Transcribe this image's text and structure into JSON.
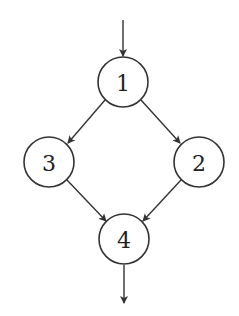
{
  "diagram": {
    "type": "directed-graph",
    "nodes": [
      {
        "id": "1",
        "label": "1",
        "cx": 123,
        "cy": 82
      },
      {
        "id": "2",
        "label": "2",
        "cx": 199,
        "cy": 162
      },
      {
        "id": "3",
        "label": "3",
        "cx": 49,
        "cy": 162
      },
      {
        "id": "4",
        "label": "4",
        "cx": 124,
        "cy": 239
      }
    ],
    "edges": [
      {
        "from": "entry",
        "to": "1"
      },
      {
        "from": "1",
        "to": "3"
      },
      {
        "from": "1",
        "to": "2"
      },
      {
        "from": "3",
        "to": "4"
      },
      {
        "from": "2",
        "to": "4"
      },
      {
        "from": "4",
        "to": "exit"
      }
    ],
    "colors": {
      "stroke": "#333333",
      "background": "#ffffff"
    }
  }
}
